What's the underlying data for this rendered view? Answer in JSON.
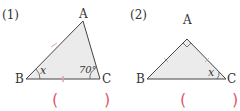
{
  "problems": [
    {
      "number": "(1)",
      "vertices": {
        "A": "A",
        "B": "B",
        "C": "C"
      },
      "angle_B": "x",
      "angle_C": "70°",
      "answer_open": "(",
      "answer_close": ")"
    },
    {
      "number": "(2)",
      "vertices": {
        "A": "A",
        "B": "B",
        "C": "C"
      },
      "angle_C": "x",
      "angle_A": "right angle",
      "answer_open": "(",
      "answer_close": ")"
    }
  ],
  "colors": {
    "fill": "#ebebeb",
    "stroke": "#444444",
    "answer_paren": "#e05a6a",
    "tick": "#e0a0a8"
  }
}
